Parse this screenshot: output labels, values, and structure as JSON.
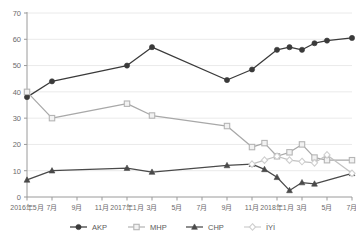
{
  "chart_data": {
    "type": "line",
    "title": "",
    "xlabel": "",
    "ylabel": "",
    "ylim": [
      0,
      70
    ],
    "ytick_values": [
      0,
      10,
      20,
      30,
      40,
      50,
      60,
      70
    ],
    "ytick_labels": [
      "0",
      "10",
      "20",
      "30",
      "40",
      "50",
      "60",
      "70"
    ],
    "grid": true,
    "grid_axis": "y",
    "legend_position": "bottom",
    "x": [
      "2016年5月",
      "2016年6月",
      "2016年7月",
      "2016年8月",
      "2016年9月",
      "2016年10月",
      "2016年11月",
      "2016年12月",
      "2017年1月",
      "2017年2月",
      "2017年3月",
      "2017年4月",
      "2017年5月",
      "2017年6月",
      "2017年7月",
      "2017年8月",
      "2017年9月",
      "2017年10月",
      "2017年11月",
      "2017年12月",
      "2018年1月",
      "2018年2月",
      "2018年3月",
      "2018年4月",
      "2018年5月",
      "2018年6月",
      "2018年7月"
    ],
    "xtick_labels": [
      "2016年5月",
      "7月",
      "9月",
      "11月",
      "2017年1月",
      "3月",
      "5月",
      "7月",
      "9月",
      "11月",
      "2018年1月",
      "3月",
      "5月",
      "7月"
    ],
    "xtick_indices": [
      0,
      2,
      4,
      6,
      8,
      10,
      12,
      14,
      16,
      18,
      20,
      22,
      24,
      26
    ],
    "series": [
      {
        "name": "AKP",
        "marker": "filled-circle",
        "color": "#3a3a3a",
        "line_color": "#3a3a3a",
        "values": [
          38.0,
          null,
          44.0,
          null,
          null,
          null,
          null,
          null,
          50.0,
          null,
          57.0,
          null,
          null,
          null,
          null,
          null,
          44.5,
          null,
          48.5,
          null,
          56.0,
          57.0,
          56.0,
          58.5,
          59.5,
          null,
          60.5
        ]
      },
      {
        "name": "MHP",
        "marker": "open-square",
        "color": "#b5b5b5",
        "line_color": "#a8a8a8",
        "values": [
          40.0,
          null,
          30.0,
          null,
          null,
          null,
          null,
          null,
          35.5,
          null,
          31.0,
          null,
          null,
          null,
          null,
          null,
          27.0,
          null,
          19.0,
          20.5,
          15.5,
          17.0,
          20.0,
          15.0,
          14.0,
          null,
          14.0
        ]
      },
      {
        "name": "CHP",
        "marker": "filled-triangle",
        "color": "#4a4a4a",
        "line_color": "#4a4a4a",
        "values": [
          6.5,
          null,
          10.0,
          null,
          null,
          null,
          null,
          null,
          11.0,
          null,
          9.5,
          null,
          null,
          null,
          null,
          null,
          12.0,
          null,
          12.5,
          10.5,
          7.5,
          2.5,
          5.5,
          5.0,
          null,
          null,
          9.0
        ]
      },
      {
        "name": "İYİ",
        "marker": "open-diamond",
        "color": "#cfcfcf",
        "line_color": "#c2c2c2",
        "values": [
          null,
          null,
          null,
          null,
          null,
          null,
          null,
          null,
          null,
          null,
          null,
          null,
          null,
          null,
          null,
          null,
          null,
          null,
          12.5,
          14.0,
          15.5,
          14.0,
          13.5,
          13.0,
          16.0,
          null,
          9.0
        ]
      }
    ],
    "legend": [
      {
        "label": "AKP",
        "marker": "filled-circle",
        "color": "#3a3a3a"
      },
      {
        "label": "MHP",
        "marker": "open-square",
        "color": "#b5b5b5"
      },
      {
        "label": "CHP",
        "marker": "filled-triangle",
        "color": "#4a4a4a"
      },
      {
        "label": "İYİ",
        "marker": "open-diamond",
        "color": "#cfcfcf"
      }
    ],
    "colors": {
      "background": "#ffffff",
      "grid": "#eaeaea",
      "axis": "#9a9a9a",
      "text": "#6b6b6b"
    }
  }
}
